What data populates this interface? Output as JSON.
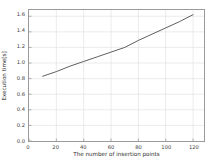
{
  "chart_data": {
    "type": "line",
    "title": "",
    "xlabel": "The number of insertion points",
    "ylabel": "Execution time[s]",
    "xlim": [
      0,
      128
    ],
    "ylim": [
      0.0,
      1.68
    ],
    "grid": true,
    "legend": null,
    "xticks": [
      0,
      20,
      40,
      60,
      80,
      100,
      120
    ],
    "xtick_labels": [
      "0",
      "20",
      "40",
      "60",
      "80",
      "100",
      "120"
    ],
    "yticks": [
      0.0,
      0.2,
      0.4,
      0.6,
      0.8,
      1.0,
      1.2,
      1.4,
      1.6
    ],
    "ytick_labels": [
      "0.0",
      "0.2",
      "0.4",
      "0.6",
      "0.8",
      "1.0",
      "1.2",
      "1.4",
      "1.6"
    ],
    "series": [
      {
        "name": "execution-time",
        "color": "#4d4d4d",
        "x": [
          10,
          20,
          30,
          40,
          50,
          60,
          70,
          80,
          90,
          100,
          110,
          120
        ],
        "values": [
          0.83,
          0.89,
          0.96,
          1.02,
          1.08,
          1.14,
          1.2,
          1.29,
          1.37,
          1.45,
          1.53,
          1.62
        ]
      }
    ]
  },
  "figure": {
    "background_color": "#ffffff",
    "frame_color": "#9a9a9a",
    "grid_color": "#e3e3e3",
    "text_color": "#3c3c3c"
  }
}
